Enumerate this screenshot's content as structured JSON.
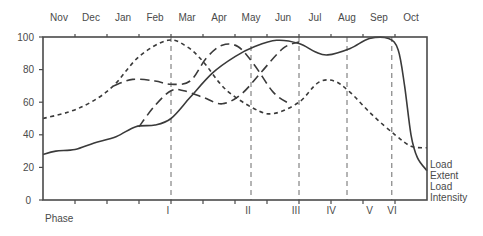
{
  "chart_data": {
    "type": "line",
    "title": "",
    "xlabel": "",
    "ylabel": "",
    "ylim": [
      0,
      100
    ],
    "yticks": [
      0,
      20,
      40,
      60,
      80,
      100
    ],
    "months": [
      "Nov",
      "Dec",
      "Jan",
      "Feb",
      "Mar",
      "Apr",
      "May",
      "Jun",
      "Jul",
      "Aug",
      "Sep",
      "Oct"
    ],
    "phase_label": "Phase",
    "phases": [
      {
        "label": "I",
        "x": 4.0
      },
      {
        "label": "II",
        "x": 6.5
      },
      {
        "label": "III",
        "x": 8.0
      },
      {
        "label": "IV",
        "x": 9.1
      },
      {
        "label": "V",
        "x": 10.3
      },
      {
        "label": "VI",
        "x": 11.0
      }
    ],
    "phase_boundaries": [
      4.0,
      6.5,
      8.0,
      9.5,
      10.9
    ],
    "right_labels": [
      "Load",
      "Extent",
      "Load",
      "Intensity"
    ],
    "grid": false,
    "legend_position": "right, inline labels",
    "series": [
      {
        "name": "Load Extent (short dash)",
        "style": "short-dash",
        "points": [
          [
            0,
            50
          ],
          [
            0.8,
            54
          ],
          [
            1.5,
            60
          ],
          [
            2.2,
            70
          ],
          [
            3.0,
            88
          ],
          [
            3.9,
            98
          ],
          [
            4.5,
            94
          ],
          [
            5.0,
            85
          ],
          [
            5.7,
            68
          ],
          [
            6.6,
            56
          ],
          [
            7.2,
            53
          ],
          [
            8.0,
            60
          ],
          [
            8.6,
            72
          ],
          [
            9.1,
            73
          ],
          [
            9.6,
            66
          ],
          [
            10.3,
            52
          ],
          [
            11.0,
            40
          ],
          [
            11.5,
            33
          ],
          [
            12.0,
            32
          ]
        ]
      },
      {
        "name": "Load (long dash, Jan plateau)",
        "style": "long-dash",
        "points": [
          [
            2.2,
            70
          ],
          [
            2.8,
            74
          ],
          [
            3.5,
            73
          ],
          [
            4.0,
            71
          ],
          [
            4.6,
            73
          ],
          [
            5.1,
            87
          ],
          [
            5.6,
            95
          ],
          [
            6.1,
            94
          ],
          [
            6.6,
            83
          ],
          [
            7.2,
            66
          ],
          [
            7.7,
            59
          ]
        ]
      },
      {
        "name": "Load (long dash, Feb rise)",
        "style": "long-dash",
        "points": [
          [
            3.0,
            45
          ],
          [
            3.5,
            58
          ],
          [
            4.0,
            67
          ],
          [
            4.4,
            67
          ],
          [
            5.0,
            63
          ],
          [
            5.6,
            59
          ],
          [
            6.2,
            65
          ],
          [
            6.8,
            78
          ],
          [
            7.5,
            93
          ],
          [
            8.0,
            97
          ]
        ]
      },
      {
        "name": "Load Intensity (solid)",
        "style": "solid",
        "points": [
          [
            0,
            28
          ],
          [
            0.4,
            30
          ],
          [
            1.0,
            31
          ],
          [
            1.6,
            35
          ],
          [
            2.3,
            39
          ],
          [
            2.9,
            45
          ],
          [
            3.5,
            46
          ],
          [
            4.0,
            50
          ],
          [
            4.6,
            63
          ],
          [
            5.3,
            78
          ],
          [
            6.0,
            88
          ],
          [
            6.6,
            94
          ],
          [
            7.3,
            98
          ],
          [
            8.0,
            96
          ],
          [
            8.5,
            91
          ],
          [
            8.9,
            89
          ],
          [
            9.6,
            93
          ],
          [
            10.2,
            99
          ],
          [
            10.8,
            99
          ],
          [
            11.1,
            92
          ],
          [
            11.3,
            70
          ],
          [
            11.5,
            40
          ],
          [
            11.7,
            26
          ],
          [
            12.0,
            18
          ]
        ]
      }
    ]
  }
}
